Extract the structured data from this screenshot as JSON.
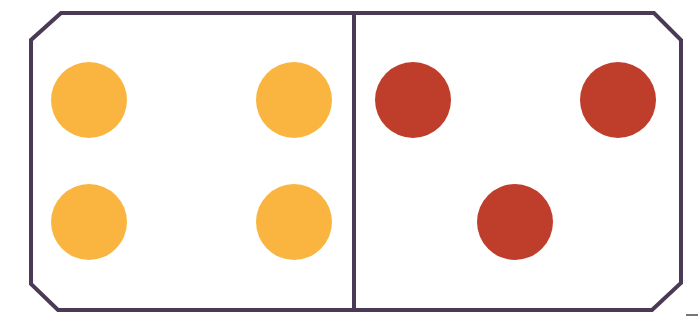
{
  "diagram": {
    "type": "domino",
    "frame_color": "#4a3a55",
    "left_half": {
      "dots": 4,
      "color": "#f9b53f"
    },
    "right_half": {
      "dots": 3,
      "color": "#bf3d2b"
    }
  },
  "dots": {
    "left": [
      {
        "cx": 89,
        "cy": 100
      },
      {
        "cx": 294,
        "cy": 100
      },
      {
        "cx": 89,
        "cy": 222
      },
      {
        "cx": 294,
        "cy": 222
      }
    ],
    "right": [
      {
        "cx": 413,
        "cy": 100
      },
      {
        "cx": 618,
        "cy": 100
      },
      {
        "cx": 515,
        "cy": 222
      }
    ]
  }
}
